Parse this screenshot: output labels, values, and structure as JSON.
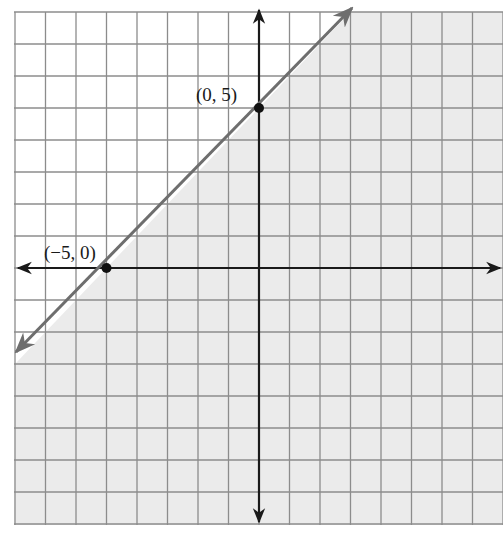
{
  "chart_data": {
    "type": "line",
    "title": "",
    "xlabel": "",
    "ylabel": "",
    "xlim": [
      -8,
      8
    ],
    "ylim": [
      -8,
      8
    ],
    "grid": true,
    "grid_step": 1,
    "legend": null,
    "series": [
      {
        "name": "boundary line y = x + 5",
        "style": "solid",
        "arrows": "both",
        "x": [
          -8,
          -5,
          0,
          3
        ],
        "y": [
          -3,
          0,
          5,
          8
        ]
      }
    ],
    "points": [
      {
        "label": "(0, 5)",
        "x": 0,
        "y": 5
      },
      {
        "label": "(-5, 0)",
        "x": -5,
        "y": 0
      }
    ],
    "shaded_region": "below line (y <= x + 5)",
    "colors": {
      "shade": "#ebebeb",
      "grid": "#8c8c8c",
      "axes": "#1a1a1a",
      "boundary": "#6e6e6e",
      "point": "#111111"
    }
  },
  "labels": {
    "point_a": "(0, 5)",
    "point_b": "(−5, 0)"
  }
}
